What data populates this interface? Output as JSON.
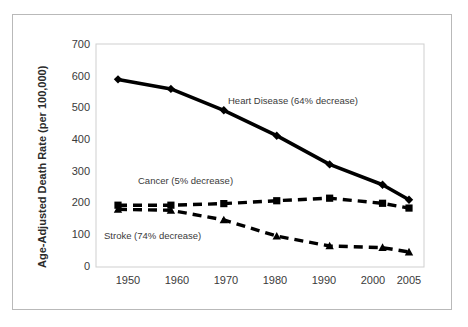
{
  "chart_data": {
    "type": "line",
    "title": "",
    "xlabel": "",
    "ylabel": "Age-Adjusted Death Rate (per 100,000)",
    "x": [
      1950,
      1960,
      1970,
      1980,
      1990,
      2000,
      2005
    ],
    "xtick_labels": [
      "1950",
      "1960",
      "1970",
      "1980",
      "1990",
      "2000",
      "2005"
    ],
    "ytick_labels": [
      "0",
      "100",
      "200",
      "300",
      "400",
      "500",
      "600",
      "700"
    ],
    "yticks": [
      0,
      100,
      200,
      300,
      400,
      500,
      600,
      700
    ],
    "ylim": [
      0,
      700
    ],
    "grid": false,
    "legend_position": "inline-annotations",
    "series": [
      {
        "name": "Heart Disease",
        "annotation": "Heart Disease (64% decrease)",
        "values": [
          589,
          559,
          492,
          412,
          322,
          258,
          211
        ],
        "style": "solid",
        "marker": "diamond",
        "color": "#000000"
      },
      {
        "name": "Cancer",
        "annotation": "Cancer (5% decrease)",
        "values": [
          194,
          194,
          199,
          208,
          216,
          200,
          185
        ],
        "style": "dashed",
        "marker": "square",
        "color": "#000000"
      },
      {
        "name": "Stroke",
        "annotation": "Stroke (74% decrease)",
        "values": [
          181,
          178,
          148,
          97,
          66,
          61,
          47
        ],
        "style": "dashed",
        "marker": "triangle",
        "color": "#000000"
      }
    ],
    "annotations": [
      {
        "text": "Heart Disease (64% decrease)",
        "x_px": 228,
        "y_px": 104
      },
      {
        "text": "Cancer (5% decrease)",
        "x_px": 138,
        "y_px": 184
      },
      {
        "text": "Stroke (74% decrease)",
        "x_px": 104,
        "y_px": 239
      }
    ]
  }
}
